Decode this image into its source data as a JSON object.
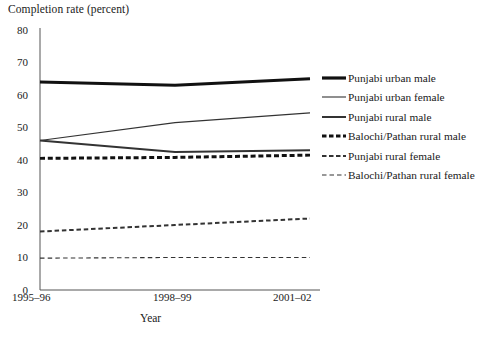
{
  "chart_data": {
    "type": "line",
    "title": "Completion rate (percent)",
    "xlabel": "Year",
    "ylabel": "",
    "categories": [
      "1995–96",
      "1998–99",
      "2001–02"
    ],
    "x": [
      0,
      1,
      2
    ],
    "ylim": [
      0,
      80
    ],
    "yticks": [
      0,
      10,
      20,
      30,
      40,
      50,
      60,
      70,
      80
    ],
    "grid": false,
    "legend_position": "right",
    "series": [
      {
        "name": "Punjabi urban male",
        "values": [
          64.0,
          63.0,
          65.0
        ],
        "style": "solid",
        "width": 3.2,
        "color": "#111111"
      },
      {
        "name": "Punjabi urban female",
        "values": [
          46.0,
          51.5,
          54.5
        ],
        "style": "solid",
        "width": 1.1,
        "color": "#333333"
      },
      {
        "name": "Punjabi rural male",
        "values": [
          46.0,
          42.5,
          43.0
        ],
        "style": "solid",
        "width": 2.0,
        "color": "#333333"
      },
      {
        "name": "Balochi/Pathan rural male",
        "values": [
          40.5,
          40.8,
          41.5
        ],
        "style": "dashed",
        "width": 3.0,
        "color": "#111111"
      },
      {
        "name": "Punjabi rural female",
        "values": [
          18.0,
          20.0,
          22.0
        ],
        "style": "dashed",
        "width": 2.0,
        "color": "#333333"
      },
      {
        "name": "Balochi/Pathan rural female",
        "values": [
          9.8,
          10.0,
          10.0
        ],
        "style": "dashed",
        "width": 1.1,
        "color": "#333333"
      }
    ]
  },
  "yticks": {
    "t80": "80",
    "t70": "70",
    "t60": "60",
    "t50": "50",
    "t40": "40",
    "t30": "30",
    "t20": "20",
    "t10": "10",
    "t0": "0"
  },
  "xticks": {
    "x0": "1995–96",
    "x1": "1998–99",
    "x2": "2001–02"
  },
  "legend": {
    "items": [
      {
        "label": "Punjabi urban male"
      },
      {
        "label": "Punjabi urban female"
      },
      {
        "label": "Punjabi rural male"
      },
      {
        "label": "Balochi/Pathan rural male"
      },
      {
        "label": "Punjabi rural female"
      },
      {
        "label": "Balochi/Pathan rural female"
      }
    ]
  },
  "axis": {
    "title": "Completion rate (percent)",
    "xlabel": "Year"
  },
  "colors": {
    "ink": "#111111",
    "ink_soft": "#333333",
    "axis": "#555555",
    "background": "#ffffff"
  }
}
